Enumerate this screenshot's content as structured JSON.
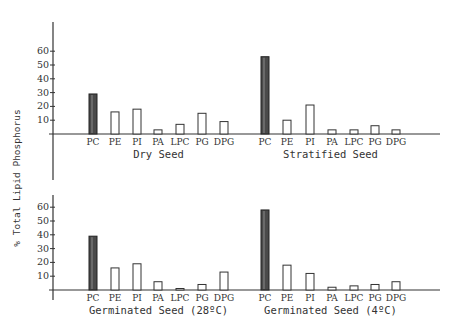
{
  "chart_data": {
    "type": "bar",
    "ylabel": "% Total Lipid Phosphorus",
    "yticks": [
      10,
      20,
      30,
      40,
      50,
      60
    ],
    "ylim": [
      0,
      60
    ],
    "grid": false,
    "highlight_category": "PC",
    "categories": [
      "PC",
      "PE",
      "PI",
      "PA",
      "LPC",
      "PG",
      "DPG"
    ],
    "panels": [
      {
        "title": "Dry Seed",
        "values": [
          29,
          16,
          18,
          3,
          7,
          15,
          9
        ]
      },
      {
        "title": "Stratified Seed",
        "values": [
          56,
          10,
          21,
          3,
          3,
          6,
          3
        ]
      },
      {
        "title": "Germinated Seed (28ºC)",
        "values": [
          39,
          16,
          19,
          6,
          1,
          4,
          13
        ]
      },
      {
        "title": "Germinated Seed (4ºC)",
        "values": [
          58,
          18,
          12,
          2,
          3,
          4,
          6
        ]
      }
    ]
  },
  "colors": {
    "ink": "#333333",
    "filled_bar": "#4a4a4a",
    "background": "#ffffff"
  }
}
